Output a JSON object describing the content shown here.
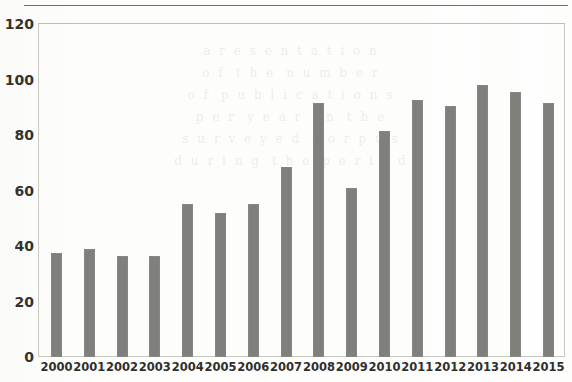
{
  "chart_data": {
    "type": "bar",
    "title": "",
    "subtitle": "",
    "xlabel": "",
    "ylabel": "",
    "categories": [
      "2000",
      "2001",
      "2002",
      "2003",
      "2004",
      "2005",
      "2006",
      "2007",
      "2008",
      "2009",
      "2010",
      "2011",
      "2012",
      "2013",
      "2014",
      "2015"
    ],
    "values": [
      37.5,
      39,
      36.5,
      36.5,
      55,
      52,
      55,
      68.5,
      91.5,
      61,
      81.5,
      92.5,
      90.5,
      98,
      95.5,
      91.5
    ],
    "ylim": [
      0,
      120
    ],
    "yticks": [
      0,
      20,
      40,
      60,
      80,
      100,
      120
    ],
    "ytick_labels": [
      "0",
      "20",
      "40",
      "60",
      "80",
      "100",
      "120"
    ],
    "grid": false,
    "legend": null,
    "series": [
      {
        "name": "",
        "values": [
          37.5,
          39,
          36.5,
          36.5,
          55,
          52,
          55,
          68.5,
          91.5,
          61,
          81.5,
          92.5,
          90.5,
          98,
          95.5,
          91.5
        ]
      }
    ]
  },
  "style": {
    "bar_color": "#7f7f7c",
    "axis_color": "#c9c9c4",
    "text_color": "#33332f",
    "background": "#fdfdfc",
    "rule_color": "#6f6f6b"
  },
  "background_text": "  a  r  e  s  e  n  t  a  t  i  o  n\n  o  f   t  h  e   n  u  m  b  e  r\n  o  f   p  u  b  l  i  c  a  t  i  o  n  s\n  p  e  r   y  e  a  r   i  n   t  h  e\n  s  u  r  v  e  y  e  d   c  o  r  p  u  s\n  d  u  r  i  n  g   t  h  e   p  e  r  i  o  d"
}
